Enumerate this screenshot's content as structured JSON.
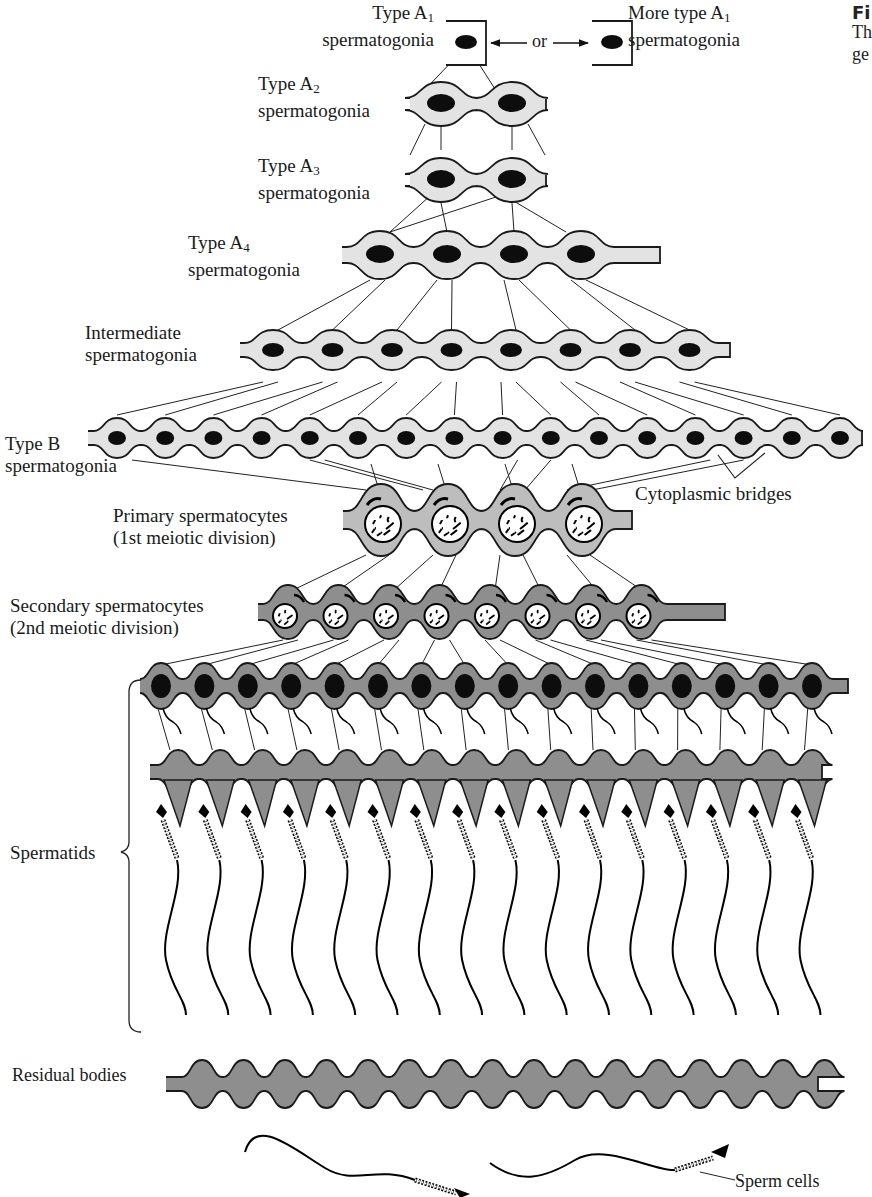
{
  "figure": {
    "heading_fragment": "Fi",
    "caption_fragments": [
      "Th",
      "ge"
    ]
  },
  "labels": {
    "type_a1_left": {
      "line1": "Type A",
      "sub": "1",
      "line2": "spermatogonia"
    },
    "or_text": "or",
    "type_a1_right": {
      "line1": "More type A",
      "sub": "1",
      "line2": "spermatogonia"
    },
    "type_a2": {
      "line1": "Type A",
      "sub": "2",
      "line2": "spermatogonia"
    },
    "type_a3": {
      "line1": "Type A",
      "sub": "3",
      "line2": "spermatogonia"
    },
    "type_a4": {
      "line1": "Type A",
      "sub": "4",
      "line2": "spermatogonia"
    },
    "intermediate": {
      "line1": "Intermediate",
      "line2": "spermatogonia"
    },
    "type_b": {
      "line1": "Type B",
      "line2": "spermatogonia"
    },
    "cytoplasmic_bridges": "Cytoplasmic bridges",
    "primary": {
      "line1": "Primary spermatocytes",
      "line2": "(1st meiotic division)"
    },
    "secondary": {
      "line1": "Secondary spermatocytes",
      "line2": "(2nd meiotic division)"
    },
    "spermatids": "Spermatids",
    "residual_bodies": "Residual bodies",
    "sperm_cells": "Sperm cells"
  },
  "stages": [
    {
      "name": "Type A1 spermatogonia",
      "cell_count": 1
    },
    {
      "name": "Type A2 spermatogonia",
      "cell_count": 2
    },
    {
      "name": "Type A3 spermatogonia",
      "cell_count": 2
    },
    {
      "name": "Type A4 spermatogonia",
      "cell_count": 4
    },
    {
      "name": "Intermediate spermatogonia",
      "cell_count": 8
    },
    {
      "name": "Type B spermatogonia",
      "cell_count": 16
    },
    {
      "name": "Primary spermatocytes",
      "cell_count": 4
    },
    {
      "name": "Secondary spermatocytes",
      "cell_count": 8
    },
    {
      "name": "Early spermatids",
      "cell_count": 16
    },
    {
      "name": "Late spermatids",
      "cell_count": 16
    },
    {
      "name": "Residual bodies",
      "cell_count": 16
    },
    {
      "name": "Sperm cells",
      "cell_count": 2
    }
  ],
  "colors": {
    "light_cytoplasm": "#e3e3e3",
    "mid_cytoplasm": "#bdbdbd",
    "dark_cytoplasm": "#8e8e8e",
    "outline": "#1a1a1a",
    "nucleus": "#0d0d0d"
  }
}
